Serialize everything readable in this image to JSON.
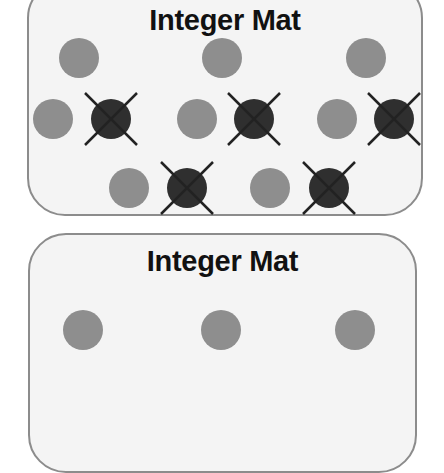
{
  "colors": {
    "mat_background": "#f4f4f4",
    "mat_border": "#8c8c8c",
    "positive_counter": "#8e8e8e",
    "negative_counter": "#2f2f2f",
    "cross_mark": "#222222"
  },
  "mats": [
    {
      "title": "Integer Mat",
      "counters": [
        {
          "type": "positive",
          "x": 79,
          "y": 58
        },
        {
          "type": "positive",
          "x": 222,
          "y": 58
        },
        {
          "type": "positive",
          "x": 366,
          "y": 58
        },
        {
          "type": "positive",
          "x": 53,
          "y": 119
        },
        {
          "type": "negative",
          "crossed": true,
          "x": 111,
          "y": 119
        },
        {
          "type": "positive",
          "x": 197,
          "y": 119
        },
        {
          "type": "negative",
          "crossed": true,
          "x": 254,
          "y": 119
        },
        {
          "type": "positive",
          "x": 337,
          "y": 119
        },
        {
          "type": "negative",
          "crossed": true,
          "x": 394,
          "y": 119
        },
        {
          "type": "positive",
          "x": 129,
          "y": 188
        },
        {
          "type": "negative",
          "crossed": true,
          "x": 187,
          "y": 188
        },
        {
          "type": "positive",
          "x": 270,
          "y": 188
        },
        {
          "type": "negative",
          "crossed": true,
          "x": 329,
          "y": 188
        }
      ],
      "summary": {
        "positive_count": 8,
        "negative_count": 5,
        "crossed_out_negatives": 5
      }
    },
    {
      "title": "Integer Mat",
      "counters": [
        {
          "type": "positive",
          "x": 83,
          "y": 330
        },
        {
          "type": "positive",
          "x": 221,
          "y": 330
        },
        {
          "type": "positive",
          "x": 355,
          "y": 330
        }
      ],
      "summary": {
        "positive_count": 3,
        "negative_count": 0
      }
    }
  ]
}
